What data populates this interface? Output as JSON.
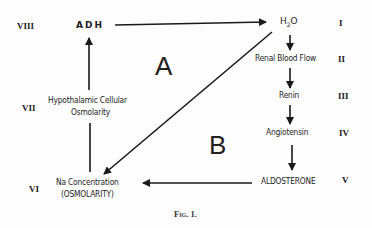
{
  "diagram": {
    "regions": [
      {
        "id": "A",
        "label": "A"
      },
      {
        "id": "B",
        "label": "B"
      }
    ],
    "nodes": [
      {
        "id": "h2o",
        "label_main": "H",
        "label_sub": "2",
        "label_tail": "O",
        "level": "I"
      },
      {
        "id": "renal",
        "label": "Renal Blood Flow",
        "level": "II"
      },
      {
        "id": "renin",
        "label": "Renin",
        "level": "III"
      },
      {
        "id": "angiotensin",
        "label": "Angiotensin",
        "level": "IV"
      },
      {
        "id": "aldosterone",
        "label": "ALDOSTERONE",
        "level": "V"
      },
      {
        "id": "na",
        "label_line1": "Na Concentration",
        "label_line2": "(OSMOLARITY)",
        "level": "VI"
      },
      {
        "id": "hypothalamic",
        "label_line1": "Hypothalamic Cellular",
        "label_line2": "Osmolarity",
        "level": "VII"
      },
      {
        "id": "adh",
        "label": "ADH",
        "level": "VIII"
      }
    ],
    "edges": [
      {
        "from": "ADH",
        "to": "H2O"
      },
      {
        "from": "H2O",
        "to": "Renal Blood Flow"
      },
      {
        "from": "Renal Blood Flow",
        "to": "Renin"
      },
      {
        "from": "Renin",
        "to": "Angiotensin"
      },
      {
        "from": "Angiotensin",
        "to": "ALDOSTERONE"
      },
      {
        "from": "ALDOSTERONE",
        "to": "Na Concentration"
      },
      {
        "from": "H2O",
        "to": "Na Concentration"
      },
      {
        "from": "Na Concentration",
        "to": "Hypothalamic Cellular Osmolarity"
      },
      {
        "from": "Hypothalamic Cellular Osmolarity",
        "to": "ADH"
      }
    ],
    "caption": "Fig. 1."
  }
}
